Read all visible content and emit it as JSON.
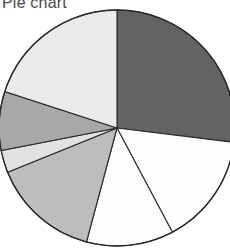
{
  "chart_data": {
    "type": "pie",
    "title": "Pie chart",
    "xlabel": "",
    "ylabel": "",
    "legend": "none",
    "grid": false,
    "start_angle_deg": 0,
    "direction": "clockwise",
    "center": {
      "x": 117,
      "y": 128
    },
    "radius": 118,
    "categories": [
      "Slice 1",
      "Slice 2",
      "Slice 3",
      "Slice 4",
      "Slice 5",
      "Slice 6",
      "Slice 7"
    ],
    "values": [
      27,
      15,
      12,
      15,
      3,
      8,
      20
    ],
    "angles_deg": [
      97,
      55,
      43,
      53,
      11,
      29,
      72
    ],
    "colors": [
      "#636363",
      "#fdfdfd",
      "#fdfdfd",
      "#bdbdbd",
      "#e2e2e2",
      "#a8a8a8",
      "#ebebeb"
    ],
    "edge_color": "#2b2b2b",
    "background_color": "#ffffff"
  },
  "figure": {
    "title": "Pie chart",
    "title_color": "#4a4a4a",
    "canvas_background": "#ffffff"
  }
}
